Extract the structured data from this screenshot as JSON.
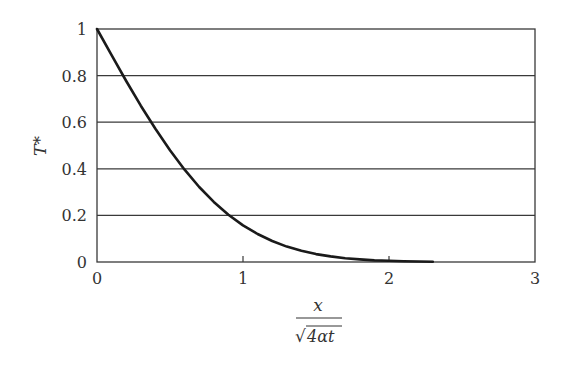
{
  "chart_data": {
    "type": "line",
    "title": "",
    "xlabel": "x / sqrt(4αt)",
    "xlabel_parts": {
      "numerator": "x",
      "denominator": "4αt",
      "radical": "√"
    },
    "ylabel": "T*",
    "xlim": [
      0,
      3
    ],
    "ylim": [
      0,
      1
    ],
    "x_ticks": [
      0,
      1,
      2,
      3
    ],
    "x_tick_labels": [
      "0",
      "1",
      "2",
      "3"
    ],
    "y_ticks": [
      0,
      0.2,
      0.4,
      0.6,
      0.8,
      1
    ],
    "y_tick_labels": [
      "0",
      "0.2",
      "0.4",
      "0.6",
      "0.8",
      "1"
    ],
    "grid": {
      "horizontal": true,
      "vertical": false
    },
    "legend": null,
    "series": [
      {
        "name": "T* (erfc)",
        "color": "#1a1a1a",
        "x": [
          0,
          0.1,
          0.2,
          0.3,
          0.4,
          0.5,
          0.6,
          0.7,
          0.8,
          0.9,
          1.0,
          1.1,
          1.2,
          1.3,
          1.4,
          1.5,
          1.6,
          1.7,
          1.8,
          1.9,
          2.0,
          2.1,
          2.2,
          2.3
        ],
        "y": [
          1.0,
          0.888,
          0.777,
          0.671,
          0.572,
          0.48,
          0.396,
          0.322,
          0.258,
          0.203,
          0.157,
          0.12,
          0.09,
          0.066,
          0.048,
          0.034,
          0.024,
          0.016,
          0.011,
          0.007,
          0.005,
          0.003,
          0.002,
          0.001
        ]
      }
    ]
  },
  "colors": {
    "axis": "#3a3a3a",
    "grid": "#3a3a3a",
    "curve": "#1a1a1a",
    "text": "#333333",
    "background": "#ffffff"
  }
}
